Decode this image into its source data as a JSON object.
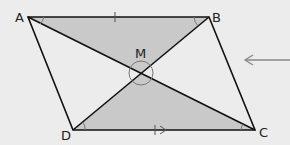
{
  "diagram": {
    "type": "parallelogram",
    "vertices": {
      "A": "A",
      "B": "B",
      "C": "C",
      "D": "D"
    },
    "intersection": "M",
    "shaded_triangles": [
      "AMB",
      "DMC"
    ],
    "colors": {
      "shade": "#c9c9c9",
      "line": "#111111",
      "background": "#ececec",
      "arrow": "#888888"
    }
  }
}
